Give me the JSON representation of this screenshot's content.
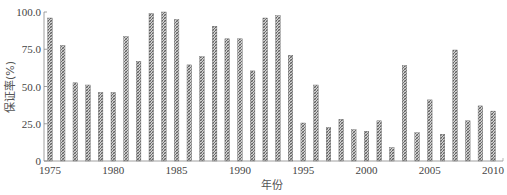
{
  "chart_data": {
    "type": "bar",
    "title": "",
    "xlabel": "年份",
    "ylabel": "保证率(%)",
    "ylim": [
      0,
      100
    ],
    "yticks": [
      "0",
      "25.0",
      "50.0",
      "75.0",
      "100.0"
    ],
    "xticks": [
      "1975",
      "1980",
      "1985",
      "1990",
      "1995",
      "2000",
      "2005",
      "2010"
    ],
    "grid": false,
    "legend": null,
    "categories": [
      "1975",
      "1976",
      "1977",
      "1978",
      "1979",
      "1980",
      "1981",
      "1982",
      "1983",
      "1984",
      "1985",
      "1986",
      "1987",
      "1988",
      "1989",
      "1990",
      "1991",
      "1992",
      "1993",
      "1994",
      "1995",
      "1996",
      "1997",
      "1998",
      "1999",
      "2000",
      "2001",
      "2002",
      "2003",
      "2004",
      "2005",
      "2006",
      "2007",
      "2008",
      "2009",
      "2010"
    ],
    "values": [
      96,
      77.5,
      52.5,
      51,
      46,
      46,
      83.5,
      67,
      99,
      100,
      95,
      64.5,
      70,
      90.5,
      82,
      82,
      60.5,
      96,
      97.5,
      71,
      25.5,
      51,
      22.5,
      28,
      21,
      20,
      27,
      9,
      64,
      19,
      41,
      18,
      74.5,
      27,
      37,
      33.5
    ],
    "bar_style": {
      "fill": "#9a9a9a",
      "hatch": "crosshatch",
      "stroke": "#555555"
    }
  }
}
